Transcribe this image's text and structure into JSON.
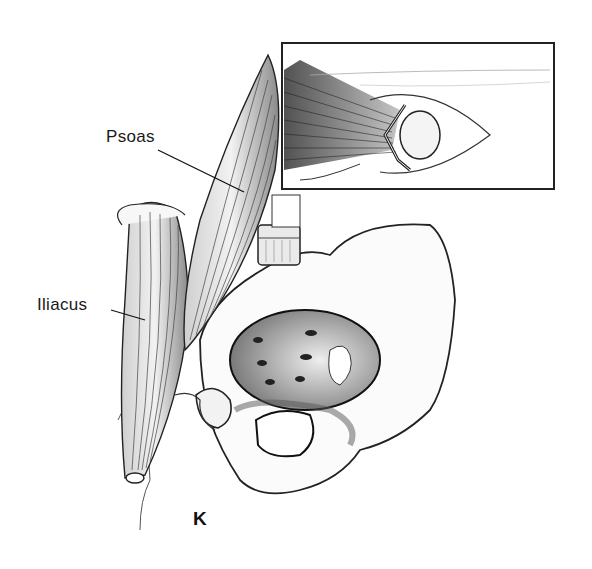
{
  "figure": {
    "panel_letter": "K",
    "labels": {
      "psoas": "Psoas",
      "iliacus": "Iliacus"
    },
    "inset": {
      "description": "Close-up inset of muscle tendon attaching to bone with suture loop"
    },
    "colors": {
      "ink": "#1a1a1a",
      "shade": "#555555",
      "light_shade": "#a0a0a0",
      "paper": "#ffffff"
    }
  }
}
